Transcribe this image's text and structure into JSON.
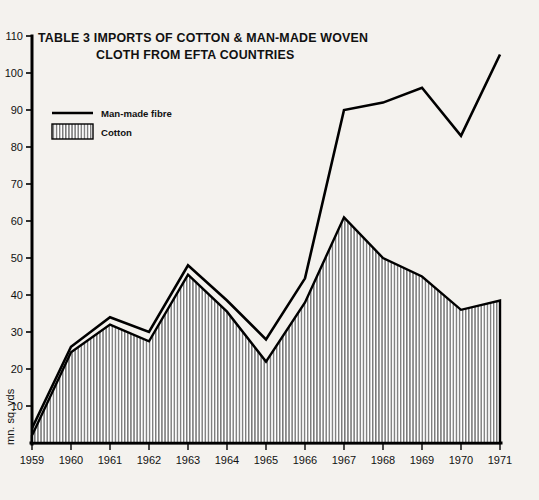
{
  "chart_data": {
    "type": "area",
    "title": "TABLE 3  IMPORTS OF COTTON & MAN-MADE WOVEN CLOTH FROM EFTA COUNTRIES",
    "title_line1": "TABLE 3  IMPORTS OF COTTON & MAN-MADE WOVEN",
    "title_line2": "CLOTH FROM EFTA COUNTRIES",
    "xlabel": "",
    "ylabel": "mn. sq. yds",
    "ylim": [
      0,
      110
    ],
    "ytick_step": 10,
    "yticks": [
      "10",
      "20",
      "30",
      "40",
      "50",
      "60",
      "70",
      "80",
      "90",
      "100",
      "110"
    ],
    "ytick_values": [
      10,
      20,
      30,
      40,
      50,
      60,
      70,
      80,
      90,
      100,
      110
    ],
    "categories": [
      "1959",
      "1960",
      "1961",
      "1962",
      "1963",
      "1964",
      "1965",
      "1966",
      "1967",
      "1968",
      "1969",
      "1970",
      "1971"
    ],
    "x": [
      1959,
      1960,
      1961,
      1962,
      1963,
      1964,
      1965,
      1966,
      1967,
      1968,
      1969,
      1970,
      1971
    ],
    "grid": false,
    "legend_position": "top-left",
    "series": [
      {
        "name": "Man-made fibre",
        "style": "line",
        "values": [
          4,
          26,
          34,
          30,
          48,
          38.5,
          28,
          44.5,
          90,
          92,
          96,
          83,
          105
        ]
      },
      {
        "name": "Cotton",
        "style": "hatched-area",
        "values": [
          2,
          24.5,
          32,
          27.5,
          45.5,
          35.5,
          22,
          38,
          61,
          50,
          45,
          36,
          38.5
        ]
      }
    ]
  },
  "legend": {
    "items": [
      {
        "label": "Man-made fibre",
        "marker": "line"
      },
      {
        "label": "Cotton",
        "marker": "hatch-swatch"
      }
    ]
  },
  "colors": {
    "ink": "#000000",
    "background": "#f4f2ee",
    "hatch": "#6f6f6f"
  }
}
